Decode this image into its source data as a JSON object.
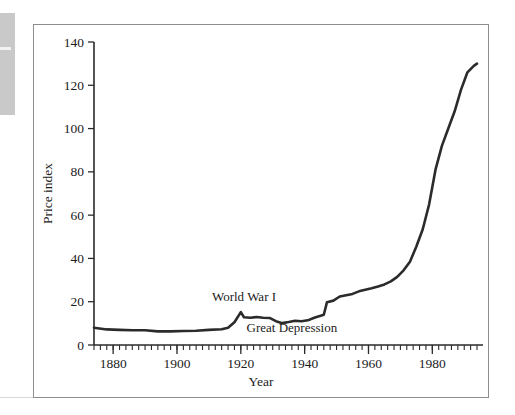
{
  "figure": {
    "frame_color": "#8d8d8d",
    "background": "#ffffff"
  },
  "chart_data": {
    "type": "line",
    "title": "",
    "subtitle": "",
    "xlabel": "Year",
    "ylabel": "Price index",
    "xlim": [
      1874,
      1994
    ],
    "ylim": [
      0,
      140
    ],
    "grid": false,
    "legend": null,
    "line_color": "#2b2b2b",
    "x_ticks_major": [
      1880,
      1900,
      1920,
      1940,
      1960,
      1980
    ],
    "x_tick_labels": [
      "1880",
      "1900",
      "1920",
      "1940",
      "1960",
      "1980"
    ],
    "x_minor_tick_step": 2,
    "y_ticks": [
      0,
      20,
      40,
      60,
      80,
      100,
      120,
      140
    ],
    "y_tick_labels": [
      "0",
      "20",
      "40",
      "60",
      "80",
      "100",
      "120",
      "140"
    ],
    "series": [
      {
        "name": "Price index",
        "x": [
          1874,
          1878,
          1882,
          1886,
          1890,
          1894,
          1898,
          1902,
          1906,
          1910,
          1914,
          1916,
          1918,
          1920,
          1921,
          1923,
          1925,
          1927,
          1929,
          1931,
          1933,
          1935,
          1937,
          1939,
          1941,
          1943,
          1945,
          1946,
          1947,
          1949,
          1951,
          1953,
          1955,
          1957,
          1959,
          1961,
          1963,
          1965,
          1967,
          1969,
          1971,
          1973,
          1975,
          1977,
          1979,
          1981,
          1983,
          1985,
          1987,
          1989,
          1991,
          1993,
          1994
        ],
        "values": [
          8,
          7.2,
          7,
          6.8,
          6.8,
          6.3,
          6.3,
          6.5,
          6.6,
          7,
          7.3,
          8,
          10.5,
          15.2,
          12.8,
          12.6,
          12.9,
          12.6,
          12.5,
          11,
          10.1,
          10.6,
          11.2,
          11,
          11.4,
          12.6,
          13.5,
          14,
          19.8,
          20.5,
          22.4,
          23,
          23.6,
          24.8,
          25.5,
          26.2,
          27,
          28,
          29.4,
          31.5,
          34.5,
          38.5,
          45.5,
          53.5,
          65,
          81,
          92,
          100,
          108,
          118,
          126,
          129,
          130
        ],
        "annotations": [
          {
            "text": "World War I",
            "x": 1921,
            "y": 20.5
          },
          {
            "text": "Great Depression",
            "x": 1936,
            "y": 6.0
          }
        ]
      }
    ]
  }
}
